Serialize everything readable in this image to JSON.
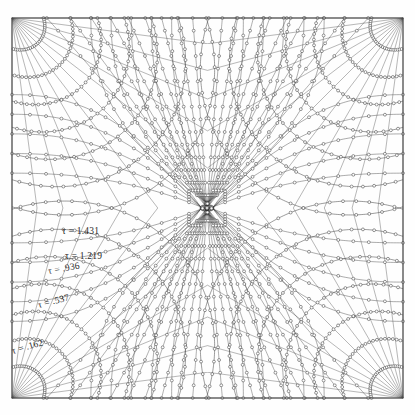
{
  "figure": {
    "type": "flow-net-contour-plot",
    "background_color": "#fefefe",
    "line_color": "#3a3a3a",
    "frame": {
      "x0": 12,
      "y0": 18,
      "x1": 403,
      "y1": 398,
      "border_color": "#4a4a4a",
      "name": "plot-frame"
    },
    "center_saddle": {
      "x": 207,
      "y": 208
    },
    "corner_singularities": [
      {
        "x": 12,
        "y": 18
      },
      {
        "x": 403,
        "y": 18
      },
      {
        "x": 12,
        "y": 398
      },
      {
        "x": 403,
        "y": 398
      }
    ],
    "marker": {
      "shape": "circle",
      "radius": 1.45,
      "fill": "#ffffff",
      "stroke": "#333333"
    }
  },
  "contour_labels": [
    {
      "text": "τ = 1.431",
      "x": 62,
      "y": 226,
      "rotate": 0,
      "name": "tau-label-1431"
    },
    {
      "text": "τ = 1.219",
      "x": 65,
      "y": 251,
      "rotate": 0,
      "name": "tau-label-1219"
    },
    {
      "text": "τ = .936",
      "x": 48,
      "y": 266,
      "rotate": -10,
      "name": "tau-label-0936"
    },
    {
      "text": "τ = .537",
      "x": 38,
      "y": 300,
      "rotate": -14,
      "name": "tau-label-0537"
    },
    {
      "text": "τ = .162",
      "x": 12,
      "y": 346,
      "rotate": -16,
      "name": "tau-label-0162"
    }
  ],
  "chart_data": {
    "type": "line",
    "title": "",
    "xlabel": "",
    "ylabel": "",
    "grid": false,
    "legend": "none",
    "contour_variable": "tau",
    "contour_values": [
      0.162,
      0.537,
      0.936,
      1.219,
      1.431
    ],
    "arc_radii_fraction": [
      0.175,
      0.325,
      0.475,
      0.625,
      0.775,
      0.925,
      1.08
    ],
    "ray_angle_count": 13,
    "markers_per_arc": 26
  }
}
